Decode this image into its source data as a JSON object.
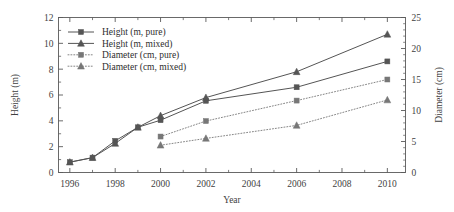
{
  "chart_data": {
    "type": "line",
    "title": "",
    "xlabel": "Year",
    "ylabel": "Height (m)",
    "y2label": "Diameter (cm)",
    "xlim": [
      1995.5,
      2010.8
    ],
    "ylim": [
      0,
      12
    ],
    "y2lim": [
      0,
      25
    ],
    "xticks": [
      1996,
      1998,
      2000,
      2002,
      2004,
      2006,
      2008,
      2010
    ],
    "xtick_labels": [
      "1996",
      "1998",
      "2000",
      "2002",
      "2004",
      "2006",
      "2008",
      "2010"
    ],
    "yticks": [
      0,
      2,
      4,
      6,
      8,
      10,
      12
    ],
    "ytick_labels": [
      "0",
      "2",
      "4",
      "6",
      "8",
      "10",
      "12"
    ],
    "y2ticks": [
      0,
      5,
      10,
      15,
      20,
      25
    ],
    "y2tick_labels": [
      "0",
      "5",
      "10",
      "15",
      "20",
      "25"
    ],
    "grid": false,
    "legend_position": "upper left",
    "series": [
      {
        "name": "Height (m, pure)",
        "axis": "left",
        "marker": "square",
        "linestyle": "solid",
        "color": "#555555",
        "x": [
          1996,
          1997,
          1998,
          1999,
          2000,
          2002,
          2006,
          2010
        ],
        "values": [
          0.8,
          1.15,
          2.45,
          3.5,
          4.05,
          5.55,
          6.6,
          8.6
        ]
      },
      {
        "name": "Height (m, mixed)",
        "axis": "left",
        "marker": "triangle",
        "linestyle": "solid",
        "color": "#555555",
        "x": [
          1996,
          1997,
          1998,
          1999,
          2000,
          2002,
          2006,
          2010
        ],
        "values": [
          0.8,
          1.15,
          2.25,
          3.5,
          4.4,
          5.8,
          7.8,
          10.7
        ]
      },
      {
        "name": "Diameter (cm, pure)",
        "axis": "right",
        "marker": "square",
        "linestyle": "dotted",
        "color": "#777777",
        "x": [
          2000,
          2002,
          2006,
          2010
        ],
        "values": [
          5.8,
          8.3,
          11.6,
          15.0
        ]
      },
      {
        "name": "Diameter (cm, mixed)",
        "axis": "right",
        "marker": "triangle",
        "linestyle": "dotted",
        "color": "#777777",
        "x": [
          2000,
          2002,
          2006,
          2010
        ],
        "values": [
          4.4,
          5.5,
          7.6,
          11.7
        ]
      }
    ]
  },
  "legend": {
    "items": [
      {
        "label": "Height (m, pure)"
      },
      {
        "label": "Height (m, mixed)"
      },
      {
        "label": "Diameter (cm, pure)"
      },
      {
        "label": "Diameter (cm, mixed)"
      }
    ]
  }
}
